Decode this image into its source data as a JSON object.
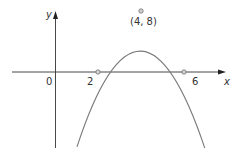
{
  "diagram": {
    "type": "parabola-graph",
    "axes": {
      "x_label": "x",
      "y_label": "y",
      "origin_label": "0"
    },
    "points": [
      {
        "name": "root-left",
        "label": "2",
        "x": 2,
        "y": 0
      },
      {
        "name": "root-right",
        "label": "6",
        "x": 6,
        "y": 0
      },
      {
        "name": "vertex",
        "label": "(4, 8)",
        "x": 4,
        "y": 8
      }
    ],
    "colors": {
      "axis": "#333333",
      "curve": "#7a7a7a",
      "point_fill": "#cccccc",
      "text": "#333333"
    }
  }
}
